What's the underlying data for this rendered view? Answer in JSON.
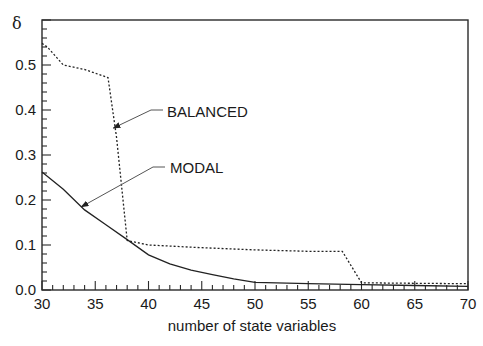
{
  "chart_data": {
    "type": "line",
    "title": "",
    "xlabel": "number of state variables",
    "ylabel": "δ",
    "xlim": [
      30,
      70
    ],
    "ylim": [
      0.0,
      0.6
    ],
    "xticks": [
      30,
      35,
      40,
      45,
      50,
      55,
      60,
      65,
      70
    ],
    "xtick_labels": [
      "30",
      "35",
      "40",
      "45",
      "50",
      "55",
      "60",
      "65",
      "70"
    ],
    "yticks": [
      0.0,
      0.1,
      0.2,
      0.3,
      0.4,
      0.5
    ],
    "ytick_labels": [
      "0.0",
      "0.1",
      "0.2",
      "0.3",
      "0.4",
      "0.5"
    ],
    "grid": false,
    "legend": "annotations with arrows",
    "series": [
      {
        "name": "BALANCED",
        "style": "dotted",
        "x": [
          30,
          30.5,
          32,
          34,
          36.2,
          37,
          38,
          40,
          45,
          50,
          55,
          58.2,
          60,
          65,
          70
        ],
        "y": [
          0.548,
          0.54,
          0.5,
          0.49,
          0.472,
          0.34,
          0.11,
          0.1,
          0.094,
          0.089,
          0.086,
          0.086,
          0.016,
          0.015,
          0.014
        ]
      },
      {
        "name": "MODAL",
        "style": "solid",
        "x": [
          30,
          32,
          34,
          36,
          38,
          40,
          42,
          44,
          46,
          48,
          50,
          55,
          60,
          65,
          70
        ],
        "y": [
          0.262,
          0.224,
          0.178,
          0.145,
          0.112,
          0.078,
          0.058,
          0.044,
          0.034,
          0.025,
          0.017,
          0.014,
          0.012,
          0.01,
          0.008
        ]
      }
    ],
    "annotations": [
      {
        "text": "BALANCED",
        "arrow_to": [
          36.7,
          0.36
        ]
      },
      {
        "text": "MODAL",
        "arrow_to": [
          33.7,
          0.185
        ]
      }
    ]
  }
}
